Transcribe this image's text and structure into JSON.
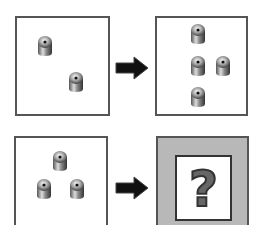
{
  "puzzle": {
    "rows": [
      {
        "input_count": 2,
        "output_count": 4
      },
      {
        "input_count": 3,
        "output_label": "?"
      }
    ],
    "icons": {
      "piece": "metal-cylinder-peg",
      "arrow": "right-arrow",
      "unknown": "question-mark"
    },
    "colors": {
      "border": "#555555",
      "arrow": "#111111",
      "unknown_bg": "#b8b8b8",
      "question_mark": "#666666"
    }
  }
}
